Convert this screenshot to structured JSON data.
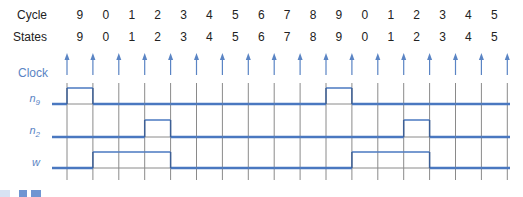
{
  "rows": {
    "cycle_label": "Cycle",
    "states_label": "States",
    "clock_label": "Clock",
    "signals": [
      {
        "name": "n",
        "sub": "9"
      },
      {
        "name": "n",
        "sub": "2"
      },
      {
        "name": "w",
        "sub": ""
      }
    ]
  },
  "cycle": [
    "9",
    "0",
    "1",
    "2",
    "3",
    "4",
    "5",
    "6",
    "7",
    "8",
    "9",
    "0",
    "1",
    "2",
    "3",
    "4",
    "5"
  ],
  "states": [
    "9",
    "0",
    "1",
    "2",
    "3",
    "4",
    "5",
    "6",
    "7",
    "8",
    "9",
    "0",
    "1",
    "2",
    "3",
    "4",
    "5"
  ],
  "colors": {
    "trace": "#4a78c0",
    "grid": "#8a8a8a",
    "clock": "#5a84c4",
    "text": "#222222"
  },
  "waveforms": {
    "n9": [
      0,
      1,
      0,
      0,
      0,
      0,
      0,
      0,
      0,
      0,
      0,
      1,
      0,
      0,
      0,
      0,
      0,
      0
    ],
    "n2": [
      0,
      0,
      0,
      0,
      1,
      0,
      0,
      0,
      0,
      0,
      0,
      0,
      0,
      0,
      1,
      0,
      0,
      0
    ],
    "w": [
      0,
      0,
      1,
      1,
      1,
      0,
      0,
      0,
      0,
      0,
      0,
      0,
      1,
      1,
      1,
      0,
      0,
      0
    ]
  }
}
